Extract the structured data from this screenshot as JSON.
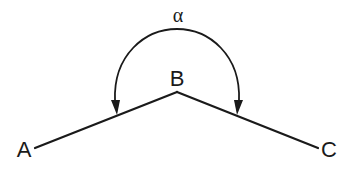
{
  "diagram": {
    "points": [
      {
        "id": "A",
        "label": "A"
      },
      {
        "id": "B",
        "label": "B"
      },
      {
        "id": "C",
        "label": "C"
      }
    ],
    "segments": [
      {
        "from": "B",
        "to": "A"
      },
      {
        "from": "B",
        "to": "C"
      }
    ],
    "angle": {
      "vertex": "B",
      "between": [
        "A",
        "C"
      ],
      "label": "α",
      "arrows": "both-ends",
      "reflex": true
    },
    "colors": {
      "stroke": "#1a1a1a",
      "background": "#ffffff"
    }
  }
}
